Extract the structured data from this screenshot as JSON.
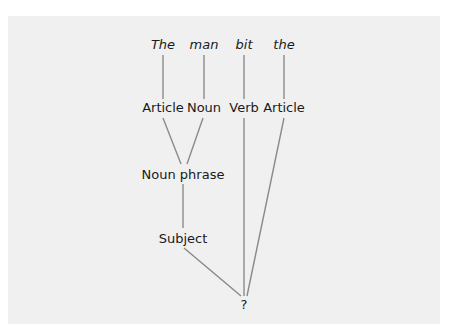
{
  "diagram": {
    "type": "parse-tree",
    "words": [
      {
        "id": "w1",
        "text": "The"
      },
      {
        "id": "w2",
        "text": "man"
      },
      {
        "id": "w3",
        "text": "bit"
      },
      {
        "id": "w4",
        "text": "the"
      }
    ],
    "categories": [
      {
        "id": "c1",
        "text": "Article"
      },
      {
        "id": "c2",
        "text": "Noun"
      },
      {
        "id": "c3",
        "text": "Verb"
      },
      {
        "id": "c4",
        "text": "Article"
      }
    ],
    "phrase": {
      "id": "np",
      "text": "Noun phrase"
    },
    "function": {
      "id": "subj",
      "text": "Subject"
    },
    "root": {
      "id": "root",
      "text": "?"
    },
    "edges": [
      [
        "w1",
        "c1"
      ],
      [
        "w2",
        "c2"
      ],
      [
        "w3",
        "c3"
      ],
      [
        "w4",
        "c4"
      ],
      [
        "c1",
        "np"
      ],
      [
        "c2",
        "np"
      ],
      [
        "np",
        "subj"
      ],
      [
        "subj",
        "root"
      ],
      [
        "c3",
        "root"
      ],
      [
        "c4",
        "root"
      ]
    ],
    "colors": {
      "background": "#f0f0f0",
      "edge": "#8a8a8a",
      "text": "#1a1a1a"
    }
  }
}
